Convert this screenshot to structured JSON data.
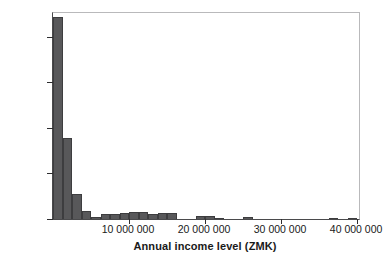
{
  "chart_data": {
    "type": "bar",
    "title": "",
    "subtitle": "",
    "xlabel": "Annual income level (ZMK)",
    "ylabel": "Number of households",
    "grid": false,
    "legend": false,
    "xlim": [
      0,
      40250000
    ],
    "ylim": [
      0,
      226
    ],
    "bin_width": 1250000,
    "x_ticks": [
      {
        "value": 10000000,
        "label": "10 000 000"
      },
      {
        "value": 20000000,
        "label": "20 000 000"
      },
      {
        "value": 30000000,
        "label": "30 000 000"
      },
      {
        "value": 40000000,
        "label": "40 000 000"
      }
    ],
    "y_ticks": [
      {
        "value": 0,
        "label": "0"
      },
      {
        "value": 50,
        "label": "50"
      },
      {
        "value": 100,
        "label": "100"
      },
      {
        "value": 150,
        "label": "150"
      },
      {
        "value": 200,
        "label": "200"
      }
    ],
    "bar_color": "#58585a",
    "bar_edge_color": "#3d3d3f",
    "axis_color": "#2d2d2f",
    "frame_color": "#b9b9bb",
    "bins": [
      {
        "x0": 0,
        "x1": 1250000,
        "count": 222
      },
      {
        "x0": 1250000,
        "x1": 2500000,
        "count": 89
      },
      {
        "x0": 2500000,
        "x1": 3750000,
        "count": 27
      },
      {
        "x0": 3750000,
        "x1": 5000000,
        "count": 9
      },
      {
        "x0": 5000000,
        "x1": 6250000,
        "count": 2
      },
      {
        "x0": 6250000,
        "x1": 7500000,
        "count": 5
      },
      {
        "x0": 7500000,
        "x1": 8750000,
        "count": 5
      },
      {
        "x0": 8750000,
        "x1": 10000000,
        "count": 7
      },
      {
        "x0": 10000000,
        "x1": 11250000,
        "count": 8
      },
      {
        "x0": 11250000,
        "x1": 12500000,
        "count": 8
      },
      {
        "x0": 12500000,
        "x1": 13750000,
        "count": 5
      },
      {
        "x0": 13750000,
        "x1": 15000000,
        "count": 7
      },
      {
        "x0": 15000000,
        "x1": 16250000,
        "count": 7
      },
      {
        "x0": 16250000,
        "x1": 17500000,
        "count": 0
      },
      {
        "x0": 17500000,
        "x1": 18750000,
        "count": 0
      },
      {
        "x0": 18750000,
        "x1": 20000000,
        "count": 3
      },
      {
        "x0": 20000000,
        "x1": 21250000,
        "count": 3
      },
      {
        "x0": 21250000,
        "x1": 22500000,
        "count": 1
      },
      {
        "x0": 22500000,
        "x1": 23750000,
        "count": 0
      },
      {
        "x0": 23750000,
        "x1": 25000000,
        "count": 0
      },
      {
        "x0": 25000000,
        "x1": 26250000,
        "count": 2
      },
      {
        "x0": 26250000,
        "x1": 27500000,
        "count": 0
      },
      {
        "x0": 27500000,
        "x1": 28750000,
        "count": 0
      },
      {
        "x0": 28750000,
        "x1": 30000000,
        "count": 0
      },
      {
        "x0": 30000000,
        "x1": 31250000,
        "count": 0
      },
      {
        "x0": 31250000,
        "x1": 32500000,
        "count": 0
      },
      {
        "x0": 32500000,
        "x1": 33750000,
        "count": 0
      },
      {
        "x0": 33750000,
        "x1": 35000000,
        "count": 0
      },
      {
        "x0": 35000000,
        "x1": 36250000,
        "count": 0
      },
      {
        "x0": 36250000,
        "x1": 37500000,
        "count": 1
      },
      {
        "x0": 37500000,
        "x1": 38750000,
        "count": 0
      },
      {
        "x0": 38750000,
        "x1": 40000000,
        "count": 1
      }
    ]
  }
}
